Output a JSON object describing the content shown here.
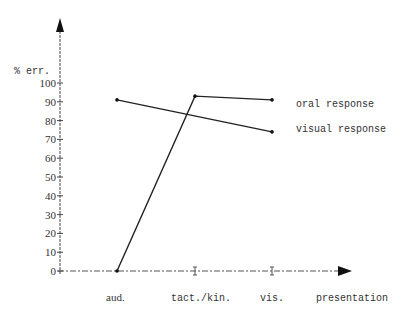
{
  "chart_data": {
    "type": "line",
    "title": "",
    "ylabel": "% err.",
    "xlabel": "presentation",
    "categories": [
      "aud.",
      "tact./kin.",
      "vis."
    ],
    "yticks": [
      0,
      10,
      20,
      30,
      40,
      50,
      60,
      70,
      80,
      90,
      100
    ],
    "ylim": [
      0,
      100
    ],
    "grid": false,
    "legend_position": "right, inline labels",
    "series": [
      {
        "name": "oral response",
        "x": [
          "aud.",
          "tact./kin.",
          "vis."
        ],
        "values": [
          0,
          93,
          91
        ]
      },
      {
        "name": "visual response",
        "x": [
          "aud.",
          "vis."
        ],
        "values": [
          91,
          74
        ]
      }
    ]
  },
  "labels": {
    "ylabel": "% err.",
    "xlabel": "presentation",
    "cat0": "aud.",
    "cat1": "tact./kin.",
    "cat2": "vis.",
    "legend_oral": "oral response",
    "legend_visual": "visual response"
  }
}
